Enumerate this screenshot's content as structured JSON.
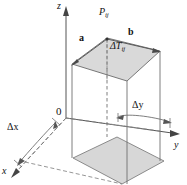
{
  "figure": {
    "type": "math-3d-diagram",
    "background_color": "#ffffff",
    "line_color": "#4d4d4d",
    "dashed_color": "#7a7a7a",
    "top_face_fill": "#d9d9d9",
    "base_face_fill": "#d4d4d4",
    "axes": {
      "z_label": "z",
      "y_label": "y",
      "x_label": "x",
      "origin_label": "0"
    },
    "labels": {
      "point": "P",
      "point_sub": "ij",
      "vector_a": "a",
      "vector_b": "b",
      "height_delta": "ΔT",
      "height_sub": "ij",
      "delta_x": "Δx",
      "delta_y": "Δy"
    }
  }
}
